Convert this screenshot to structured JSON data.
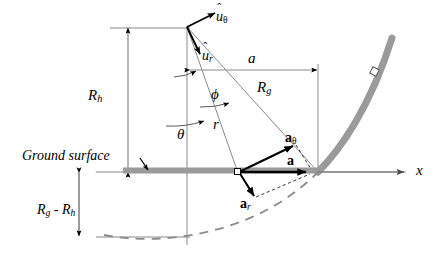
{
  "figure": {
    "type": "physics-vector-diagram",
    "title": ""
  },
  "colors": {
    "ink": "#000000",
    "thin_line": "#808080",
    "ground_gray": "#9a9a9a",
    "dashed_gray": "#8c8c8c",
    "background": "#ffffff"
  },
  "labels": {
    "u_theta": {
      "base": "u",
      "hat": "ˆ",
      "sub": "θ"
    },
    "u_r": {
      "base": "u",
      "hat": "ˆ",
      "sub": "r"
    },
    "R_h": {
      "base": "R",
      "sub": "h"
    },
    "R_g": {
      "base": "R",
      "sub": "g"
    },
    "R_g_minus_R_h": {
      "base": "R",
      "sub": "g",
      "op": " - ",
      "base2": "R",
      "sub2": "h"
    },
    "a_dim": "a",
    "phi": "ϕ",
    "theta": "θ",
    "r": "r",
    "ground_surface": "Ground surface",
    "a_vec": {
      "base": "a"
    },
    "a_theta": {
      "base": "a",
      "sub": "θ"
    },
    "a_r": {
      "base": "a",
      "sub": "r"
    },
    "x_axis": "x"
  },
  "geometry": {
    "apex": {
      "x": 187,
      "y": 26
    },
    "origin": {
      "x": 318,
      "y": 172
    },
    "point_p": {
      "x": 238,
      "y": 172
    },
    "ground_y": 172,
    "bottom_arc_y": 237,
    "vertical_axis_x": 318,
    "a_dim_y": 70,
    "top_dim_y": 28,
    "Rh_dim_x": 128,
    "Rg_minus_Rh_dim_x": 79,
    "x_axis_end": 406
  },
  "elements": {
    "ground_line": "thick gray horizontal band",
    "earth_curve": "thick gray curve rising to upper right",
    "dashed_arc": "dashed gray arc below ground",
    "square_marker": "small open square on earth curve"
  }
}
